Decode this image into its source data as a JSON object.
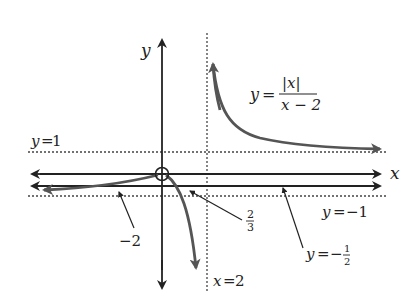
{
  "diagram": {
    "type": "function-graph",
    "function_label": {
      "lhs": "y",
      "equals": "=",
      "numerator": "|x|",
      "denominator": "x − 2"
    },
    "axes": {
      "x_label": "x",
      "y_label": "y"
    },
    "asymptotes": [
      {
        "label": "y=1",
        "lhs": "y",
        "rhs": "1",
        "style": "dotted"
      },
      {
        "label": "y=−1",
        "lhs": "y",
        "rhs": "−1",
        "style": "dotted"
      },
      {
        "label": "x=2",
        "lhs": "x",
        "rhs": "2",
        "style": "dotted"
      }
    ],
    "annotations": {
      "minus_two": "−2",
      "two_thirds_num": "2",
      "two_thirds_den": "3",
      "half_line": {
        "lhs": "y",
        "equals": "=",
        "minus": "−",
        "num": "1",
        "den": "2"
      }
    },
    "colors": {
      "axis": "#222222",
      "curve": "#555555",
      "dotted": "#444444",
      "background": "#ffffff"
    }
  }
}
